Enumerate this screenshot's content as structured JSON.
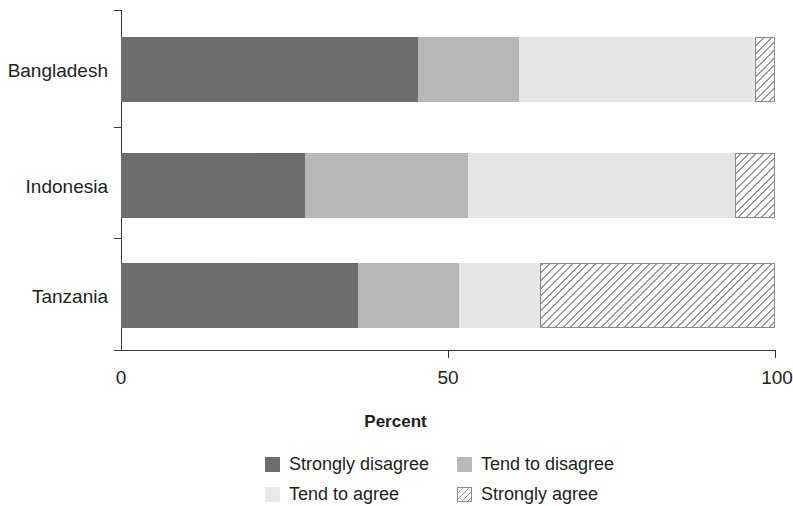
{
  "chart_data": {
    "type": "bar",
    "orientation": "horizontal",
    "stacked": true,
    "stack_total": 100,
    "title": "",
    "xlabel": "Percent",
    "ylabel": "",
    "xlim": [
      0,
      100
    ],
    "xticks": [
      0,
      50,
      100
    ],
    "xticklabels": [
      "0",
      "50",
      "100"
    ],
    "grid": false,
    "legend_position": "bottom",
    "categories": [
      "Bangladesh",
      "Indonesia",
      "Tanzania"
    ],
    "series": [
      {
        "name": "Strongly disagree",
        "color": "#6d6d6d",
        "pattern": "solid",
        "values": [
          45.4,
          28.1,
          36.2
        ]
      },
      {
        "name": "Tend to disagree",
        "color": "#b9b9b9",
        "pattern": "solid",
        "values": [
          15.5,
          25.0,
          15.5
        ]
      },
      {
        "name": "Tend to agree",
        "color": "#e9e9e9",
        "pattern": "solid",
        "values": [
          36.0,
          40.8,
          12.4
        ]
      },
      {
        "name": "Strongly agree",
        "color": "#ffffff",
        "pattern": "diagonal-hatch",
        "values": [
          3.1,
          6.1,
          35.9
        ]
      }
    ],
    "segment_boundaries": {
      "Bangladesh": [
        45.4,
        60.9,
        96.9,
        100
      ],
      "Indonesia": [
        28.1,
        53.1,
        93.9,
        100
      ],
      "Tanzania": [
        36.2,
        51.7,
        64.1,
        100
      ]
    }
  },
  "axis": {
    "x_title": "Percent",
    "tick_labels": [
      "0",
      "50",
      "100"
    ],
    "category_labels": [
      "Bangladesh",
      "Indonesia",
      "Tanzania"
    ]
  },
  "legend": {
    "items": [
      {
        "label": "Strongly disagree",
        "swatch": "solid-dark-gray"
      },
      {
        "label": "Tend to disagree",
        "swatch": "solid-medium-gray"
      },
      {
        "label": "Tend to agree",
        "swatch": "solid-light-gray"
      },
      {
        "label": "Strongly agree",
        "swatch": "diagonal-hatch"
      }
    ]
  }
}
